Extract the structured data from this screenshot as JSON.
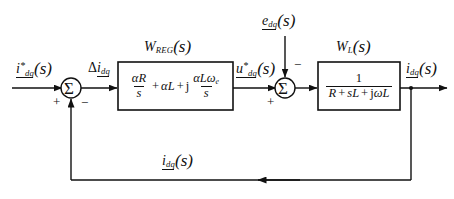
{
  "diagram": {
    "type": "control-block-diagram",
    "background_color": "#ffffff",
    "line_color": "#111111",
    "signals": {
      "reference": {
        "name": "current-reference",
        "base": "i",
        "superscript": "*",
        "subscript": "dq",
        "argument": "(s)"
      },
      "error": {
        "name": "current-error",
        "prefix": "Δ",
        "base": "i",
        "subscript": "dq",
        "argument": ""
      },
      "control_voltage": {
        "name": "voltage-reference",
        "base": "u",
        "superscript": "*",
        "subscript": "dq",
        "argument": "(s)"
      },
      "disturbance": {
        "name": "back-emf-disturbance",
        "base": "e",
        "subscript": "dq",
        "argument": "(s)"
      },
      "output": {
        "name": "current-output",
        "base": "i",
        "subscript": "dq",
        "argument": "(s)"
      },
      "feedback": {
        "name": "current-feedback",
        "base": "i",
        "subscript": "dq",
        "argument": "(s)"
      }
    },
    "blocks": [
      {
        "id": "regulator",
        "label_base": "W",
        "label_subscript": "REG",
        "label_argument": "(s)",
        "expression": "αR/s + αL + j·αLωe/s",
        "terms": {
          "t1_num": "αR",
          "t1_den": "s",
          "op1": "+",
          "t2": "αL",
          "op2": "+",
          "imag": "j",
          "t3_num": "αLω",
          "t3_num_sub": "e",
          "t3_den": "s"
        }
      },
      {
        "id": "load",
        "label_base": "W",
        "label_subscript": "L",
        "label_argument": "(s)",
        "expression": "1 / (R + sL + jωL)",
        "terms": {
          "num": "1",
          "den": "R + sL + jωL",
          "den_r": "R",
          "den_op1": "+",
          "den_sl": "sL",
          "den_op2": "+",
          "den_j": "j",
          "den_wl": "ωL"
        }
      }
    ],
    "summing_junctions": [
      {
        "id": "error-summer",
        "glyph": "Σ",
        "inputs": [
          {
            "port": "left",
            "sign": "+"
          },
          {
            "port": "bottom",
            "sign": "−"
          }
        ]
      },
      {
        "id": "disturbance-summer",
        "glyph": "Σ",
        "inputs": [
          {
            "port": "left",
            "sign": "+"
          },
          {
            "port": "top",
            "sign": "−"
          }
        ]
      }
    ]
  }
}
